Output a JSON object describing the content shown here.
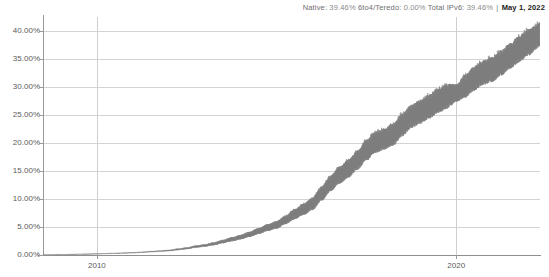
{
  "header": {
    "native_label": "Native:",
    "native_value": "39.46%",
    "tunnel_label": "6to4/Teredo:",
    "tunnel_value": "0.00%",
    "total_label": "Total IPv6:",
    "total_value": "39.46%",
    "separator": "|",
    "date": "May 1, 2022"
  },
  "chart_data": {
    "type": "area",
    "title": "",
    "subtitle": "",
    "xlabel": "",
    "ylabel": "",
    "grid": true,
    "legend_position": "none",
    "xlim": [
      2008.5,
      2022.33
    ],
    "ylim": [
      0,
      42.5
    ],
    "ytick_labels": [
      "0.00%",
      "5.00%",
      "10.00%",
      "15.00%",
      "20.00%",
      "25.00%",
      "30.00%",
      "35.00%",
      "40.00%"
    ],
    "ytick_values": [
      0,
      5,
      10,
      15,
      20,
      25,
      30,
      35,
      40
    ],
    "xtick_labels": [
      "2010",
      "2020"
    ],
    "xtick_values": [
      2010,
      2020
    ],
    "series": [
      {
        "name": "Total IPv6 adoption",
        "color": "#7d7d7d",
        "description": "Daily Google IPv6 adoption rate with weekday/weekend oscillation band",
        "x": [
          2008.75,
          2009.0,
          2009.25,
          2009.5,
          2009.75,
          2010.0,
          2010.25,
          2010.5,
          2010.75,
          2011.0,
          2011.25,
          2011.5,
          2011.75,
          2012.0,
          2012.25,
          2012.5,
          2012.75,
          2013.0,
          2013.25,
          2013.5,
          2013.75,
          2014.0,
          2014.25,
          2014.5,
          2014.75,
          2015.0,
          2015.25,
          2015.5,
          2015.75,
          2016.0,
          2016.25,
          2016.5,
          2016.75,
          2017.0,
          2017.25,
          2017.5,
          2017.75,
          2018.0,
          2018.25,
          2018.5,
          2018.75,
          2019.0,
          2019.25,
          2019.5,
          2019.75,
          2020.0,
          2020.25,
          2020.5,
          2020.75,
          2021.0,
          2021.25,
          2021.5,
          2021.75,
          2022.0,
          2022.33
        ],
        "mean": [
          0.05,
          0.08,
          0.1,
          0.13,
          0.17,
          0.2,
          0.25,
          0.3,
          0.35,
          0.4,
          0.5,
          0.6,
          0.7,
          0.8,
          1.0,
          1.2,
          1.5,
          1.7,
          2.0,
          2.4,
          2.8,
          3.2,
          3.7,
          4.3,
          4.9,
          5.4,
          6.3,
          7.3,
          8.2,
          9.2,
          11.0,
          12.8,
          14.3,
          15.5,
          17.0,
          18.8,
          20.2,
          20.8,
          21.6,
          23.3,
          24.8,
          25.6,
          26.6,
          27.6,
          28.4,
          29.0,
          30.2,
          31.6,
          32.6,
          33.2,
          34.4,
          35.6,
          36.8,
          38.0,
          39.46
        ],
        "band_amplitude": [
          0.02,
          0.02,
          0.03,
          0.03,
          0.04,
          0.05,
          0.05,
          0.06,
          0.07,
          0.08,
          0.1,
          0.12,
          0.14,
          0.16,
          0.2,
          0.24,
          0.3,
          0.34,
          0.4,
          0.48,
          0.56,
          0.64,
          0.74,
          0.86,
          0.98,
          1.08,
          1.26,
          1.46,
          1.64,
          1.84,
          2.1,
          2.3,
          2.5,
          2.6,
          2.8,
          3.0,
          3.1,
          3.1,
          3.2,
          3.3,
          3.4,
          3.4,
          3.5,
          3.5,
          3.6,
          2.6,
          3.3,
          3.5,
          3.6,
          3.6,
          3.7,
          3.7,
          3.8,
          3.8,
          3.6
        ]
      }
    ]
  },
  "colors": {
    "series": "#7d7d7d",
    "grid": "#d3d3d3",
    "axis": "#9a9a9a",
    "tick_text": "#5a5a5a",
    "header_text": "#8a8a8a",
    "header_date": "#1c1c1c",
    "background": "#ffffff"
  }
}
